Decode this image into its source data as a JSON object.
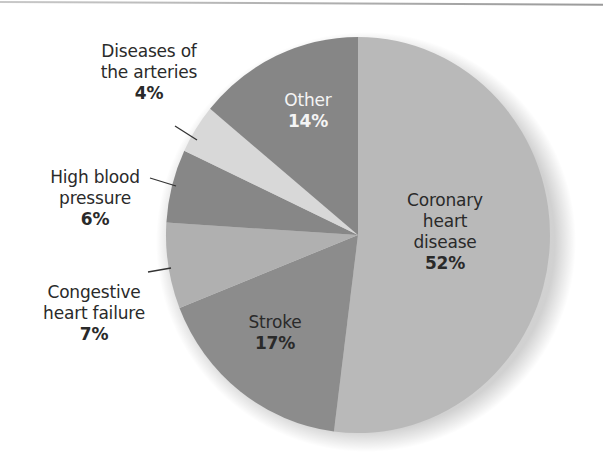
{
  "chart_data": {
    "type": "pie",
    "title": "",
    "start_angle_deg": -90,
    "direction": "clockwise",
    "slices": [
      {
        "label": "Coronary heart disease",
        "lines": [
          "Coronary",
          "heart",
          "disease"
        ],
        "value": 52,
        "pct_text": "52%",
        "color": "#b9b9b9",
        "label_inside": true
      },
      {
        "label": "Stroke",
        "lines": [
          "Stroke"
        ],
        "value": 17,
        "pct_text": "17%",
        "color": "#8c8c8c",
        "label_inside": true
      },
      {
        "label": "Congestive heart failure",
        "lines": [
          "Congestive",
          "heart failure"
        ],
        "value": 7,
        "pct_text": "7%",
        "color": "#b0b0b0",
        "label_inside": false
      },
      {
        "label": "High blood pressure",
        "lines": [
          "High blood",
          "pressure"
        ],
        "value": 6,
        "pct_text": "6%",
        "color": "#878787",
        "label_inside": false
      },
      {
        "label": "Diseases of the arteries",
        "lines": [
          "Diseases of",
          "the arteries"
        ],
        "value": 4,
        "pct_text": "4%",
        "color": "#d8d8d8",
        "label_inside": false
      },
      {
        "label": "Other",
        "lines": [
          "Other"
        ],
        "value": 14,
        "pct_text": "14%",
        "color": "#868686",
        "label_inside": true
      }
    ],
    "legend": null
  },
  "labels": {
    "coronary": {
      "l1": "Coronary",
      "l2": "heart",
      "l3": "disease",
      "pct": "52%"
    },
    "stroke": {
      "l1": "Stroke",
      "pct": "17%"
    },
    "congestive": {
      "l1": "Congestive",
      "l2": "heart failure",
      "pct": "7%"
    },
    "high_bp": {
      "l1": "High blood",
      "l2": "pressure",
      "pct": "6%"
    },
    "arteries": {
      "l1": "Diseases of",
      "l2": "the arteries",
      "pct": "4%"
    },
    "other": {
      "l1": "Other",
      "pct": "14%"
    }
  }
}
